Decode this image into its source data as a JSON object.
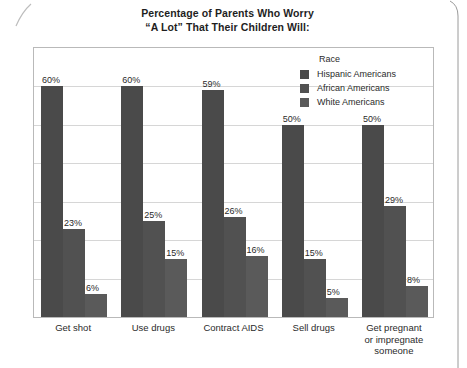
{
  "chart_data": {
    "type": "bar",
    "title": "Percentage of Parents Who Worry\n“A Lot” That Their Children Will:",
    "xlabel": "",
    "ylabel": "",
    "ylim": [
      0,
      70
    ],
    "grid": true,
    "gridline_step": 10,
    "legend_position": "top-right-inside",
    "legend_title": "Race",
    "categories": [
      "Get shot",
      "Use drugs",
      "Contract AIDS",
      "Sell drugs",
      "Get pregnant\nor impregnate\nsomeone"
    ],
    "series": [
      {
        "name": "Hispanic Americans",
        "color": "#4a4a4a",
        "values": [
          60,
          60,
          59,
          50,
          50
        ],
        "labels": [
          "60%",
          "60%",
          "59%",
          "50%",
          "50%"
        ]
      },
      {
        "name": "African Americans",
        "color": "#515151",
        "values": [
          23,
          25,
          26,
          15,
          29
        ],
        "labels": [
          "23%",
          "25%",
          "26%",
          "15%",
          "29%"
        ]
      },
      {
        "name": "White Americans",
        "color": "#5a5a5a",
        "values": [
          6,
          15,
          16,
          5,
          8
        ],
        "labels": [
          "6%",
          "15%",
          "16%",
          "5%",
          "8%"
        ]
      }
    ]
  }
}
